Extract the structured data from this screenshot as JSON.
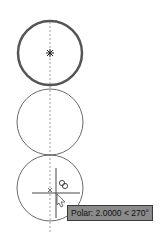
{
  "drawing": {
    "circles": [
      {
        "name": "selected-circle",
        "cx": 50,
        "cy": 53,
        "r": 32,
        "stroke": "#555555",
        "width": 2.5
      },
      {
        "name": "middle-circle",
        "cx": 50,
        "cy": 122,
        "r": 33,
        "stroke": "#444444",
        "width": 0.8
      },
      {
        "name": "bottom-circle",
        "cx": 50,
        "cy": 188,
        "r": 33,
        "stroke": "#444444",
        "width": 0.8
      }
    ],
    "tracking_line_color": "#777777"
  },
  "tooltip": {
    "text": "Polar: 2.0000 < 270°",
    "background": "#8a8a8a"
  }
}
